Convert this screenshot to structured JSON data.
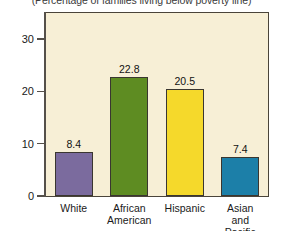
{
  "chart_data": {
    "type": "bar",
    "title": "",
    "subtitle": "(Percentage of families living below poverty line)",
    "categories": [
      "White",
      "African\nAmerican",
      "Hispanic",
      "Asian and\nPacific Islander"
    ],
    "values": [
      8.4,
      22.8,
      20.5,
      7.4
    ],
    "value_labels": [
      "8.4",
      "22.8",
      "20.5",
      "7.4"
    ],
    "bar_colors": [
      "#7b6b9e",
      "#5e8c22",
      "#f5d92b",
      "#1c7fa8"
    ],
    "xlabel": "",
    "ylabel": "",
    "ylim": [
      0,
      35
    ],
    "yticks": [
      0,
      10,
      20,
      30
    ],
    "ytick_labels": [
      "0",
      "10",
      "20",
      "30"
    ],
    "grid": false,
    "legend": "none",
    "plot_background": "#f7efd6",
    "frame_color": "#4a443a"
  }
}
